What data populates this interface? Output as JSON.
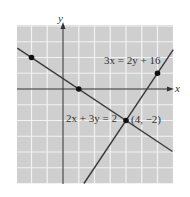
{
  "chart_data": {
    "type": "line",
    "title": "",
    "xlabel": "x",
    "ylabel": "y",
    "xlim": [
      -2.92,
      6.98
    ],
    "ylim": [
      -6.03,
      4.06
    ],
    "grid": true,
    "legend": "none",
    "series": [
      {
        "name": "2x + 3y = 2",
        "equation": "2x + 3y = 2",
        "endpoints": [
          [
            -2.9,
            2.6
          ],
          [
            6.95,
            -3.97
          ]
        ],
        "marked_points": [
          [
            -2,
            2
          ],
          [
            1,
            0
          ]
        ]
      },
      {
        "name": "3x = 2y + 16",
        "equation": "3x = 2y + 16",
        "endpoints": [
          [
            1.33,
            -6.0
          ],
          [
            7.0,
            2.5
          ]
        ],
        "marked_points": [
          [
            6,
            1
          ]
        ]
      }
    ],
    "annotations": [
      {
        "text": "(4, −2)",
        "x": 4,
        "y": -2,
        "note": "intersection point"
      },
      {
        "text": "2x + 3y = 2",
        "anchor": [
          -0.2,
          -1.85
        ]
      },
      {
        "text": "3x = 2y + 16",
        "anchor": [
          2.6,
          1.8
        ]
      }
    ]
  },
  "labels": {
    "x_axis": "x",
    "y_axis": "y",
    "line1": "2x + 3y = 2",
    "line2": "3x = 2y + 16",
    "intersection": "(4, −2)"
  },
  "colors": {
    "grid_background": "#cfcfcf",
    "grid_lines": "#f2f2f2",
    "axes": "#333333",
    "lines": "#3a3a3a",
    "points": "#111111"
  }
}
